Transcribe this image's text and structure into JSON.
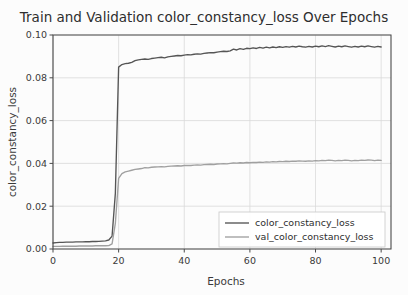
{
  "chart_data": {
    "type": "line",
    "title": "Train and Validation color_constancy_loss Over Epochs",
    "xlabel": "Epochs",
    "ylabel": "color_constancy_loss",
    "xlim": [
      0,
      103
    ],
    "ylim": [
      0,
      0.1
    ],
    "xticks": [
      0,
      20,
      40,
      60,
      80,
      100
    ],
    "xtick_labels": [
      "0",
      "20",
      "40",
      "60",
      "80",
      "100"
    ],
    "yticks": [
      0.0,
      0.02,
      0.04,
      0.06,
      0.08,
      0.1
    ],
    "ytick_labels": [
      "0.00",
      "0.02",
      "0.04",
      "0.06",
      "0.08",
      "0.10"
    ],
    "grid": true,
    "legend_position": "lower right",
    "colors": {
      "train": "#555555",
      "val": "#a0a0a0",
      "grid": "#d9d9d9",
      "axis": "#4a4a4a",
      "background": "#fcfcfc"
    },
    "series": [
      {
        "name": "color_constancy_loss",
        "color": "#555555",
        "x": [
          0,
          1,
          2,
          3,
          4,
          5,
          6,
          7,
          8,
          9,
          10,
          11,
          12,
          13,
          14,
          15,
          16,
          17,
          18,
          19,
          20,
          21,
          22,
          23,
          24,
          25,
          26,
          27,
          28,
          29,
          30,
          31,
          32,
          33,
          34,
          35,
          36,
          37,
          38,
          39,
          40,
          41,
          42,
          43,
          44,
          45,
          46,
          47,
          48,
          49,
          50,
          51,
          52,
          53,
          54,
          55,
          56,
          57,
          58,
          59,
          60,
          61,
          62,
          63,
          64,
          65,
          66,
          67,
          68,
          69,
          70,
          71,
          72,
          73,
          74,
          75,
          76,
          77,
          78,
          79,
          80,
          81,
          82,
          83,
          84,
          85,
          86,
          87,
          88,
          89,
          90,
          91,
          92,
          93,
          94,
          95,
          96,
          97,
          98,
          99,
          100
        ],
        "values": [
          0.0028,
          0.003,
          0.0031,
          0.0031,
          0.0032,
          0.0032,
          0.0032,
          0.0033,
          0.0033,
          0.0033,
          0.0034,
          0.0034,
          0.0035,
          0.0035,
          0.0036,
          0.0037,
          0.0038,
          0.0042,
          0.006,
          0.026,
          0.085,
          0.0862,
          0.0866,
          0.0868,
          0.0872,
          0.088,
          0.0884,
          0.0886,
          0.0888,
          0.0886,
          0.089,
          0.0892,
          0.0894,
          0.0896,
          0.0893,
          0.0898,
          0.09,
          0.0902,
          0.0904,
          0.0903,
          0.0906,
          0.0908,
          0.0907,
          0.091,
          0.0912,
          0.0911,
          0.0914,
          0.0916,
          0.0918,
          0.0917,
          0.092,
          0.0922,
          0.0924,
          0.0923,
          0.0926,
          0.0934,
          0.093,
          0.0936,
          0.0933,
          0.0938,
          0.0936,
          0.094,
          0.0937,
          0.0942,
          0.0939,
          0.0943,
          0.094,
          0.0944,
          0.0941,
          0.0945,
          0.0942,
          0.0946,
          0.0943,
          0.0947,
          0.0944,
          0.0948,
          0.0945,
          0.0943,
          0.0947,
          0.0944,
          0.0948,
          0.0945,
          0.0949,
          0.0946,
          0.095,
          0.0947,
          0.0944,
          0.0948,
          0.0945,
          0.0949,
          0.0946,
          0.0943,
          0.0947,
          0.0944,
          0.0948,
          0.0945,
          0.0949,
          0.0946,
          0.0943,
          0.0947,
          0.0944
        ]
      },
      {
        "name": "val_color_constancy_loss",
        "color": "#a0a0a0",
        "x": [
          0,
          1,
          2,
          3,
          4,
          5,
          6,
          7,
          8,
          9,
          10,
          11,
          12,
          13,
          14,
          15,
          16,
          17,
          18,
          19,
          20,
          21,
          22,
          23,
          24,
          25,
          26,
          27,
          28,
          29,
          30,
          31,
          32,
          33,
          34,
          35,
          36,
          37,
          38,
          39,
          40,
          41,
          42,
          43,
          44,
          45,
          46,
          47,
          48,
          49,
          50,
          51,
          52,
          53,
          54,
          55,
          56,
          57,
          58,
          59,
          60,
          61,
          62,
          63,
          64,
          65,
          66,
          67,
          68,
          69,
          70,
          71,
          72,
          73,
          74,
          75,
          76,
          77,
          78,
          79,
          80,
          81,
          82,
          83,
          84,
          85,
          86,
          87,
          88,
          89,
          90,
          91,
          92,
          93,
          94,
          95,
          96,
          97,
          98,
          99,
          100
        ],
        "values": [
          0.0012,
          0.0012,
          0.0012,
          0.0013,
          0.0013,
          0.0013,
          0.0013,
          0.0013,
          0.0014,
          0.0014,
          0.0014,
          0.0014,
          0.0014,
          0.0015,
          0.0015,
          0.0015,
          0.0015,
          0.0016,
          0.0024,
          0.012,
          0.033,
          0.0352,
          0.036,
          0.0364,
          0.0368,
          0.0372,
          0.0374,
          0.0376,
          0.038,
          0.0379,
          0.0382,
          0.0383,
          0.0384,
          0.0385,
          0.0384,
          0.0386,
          0.0387,
          0.0388,
          0.0389,
          0.0388,
          0.039,
          0.0391,
          0.039,
          0.0392,
          0.0393,
          0.0392,
          0.0394,
          0.0395,
          0.0396,
          0.0395,
          0.0397,
          0.0398,
          0.0399,
          0.0398,
          0.04,
          0.0402,
          0.0401,
          0.0403,
          0.0402,
          0.0404,
          0.0403,
          0.0405,
          0.0404,
          0.0406,
          0.0405,
          0.0407,
          0.0406,
          0.0408,
          0.0407,
          0.0409,
          0.0408,
          0.041,
          0.0409,
          0.0411,
          0.041,
          0.0412,
          0.0411,
          0.041,
          0.0412,
          0.0411,
          0.0413,
          0.0412,
          0.0414,
          0.0413,
          0.0415,
          0.0414,
          0.0412,
          0.0414,
          0.0413,
          0.0415,
          0.0414,
          0.0412,
          0.0414,
          0.0413,
          0.0415,
          0.0414,
          0.0416,
          0.0415,
          0.0413,
          0.0415,
          0.0414
        ]
      }
    ],
    "legend": [
      {
        "label": "color_constancy_loss",
        "color": "#555555"
      },
      {
        "label": "val_color_constancy_loss",
        "color": "#a0a0a0"
      }
    ]
  }
}
